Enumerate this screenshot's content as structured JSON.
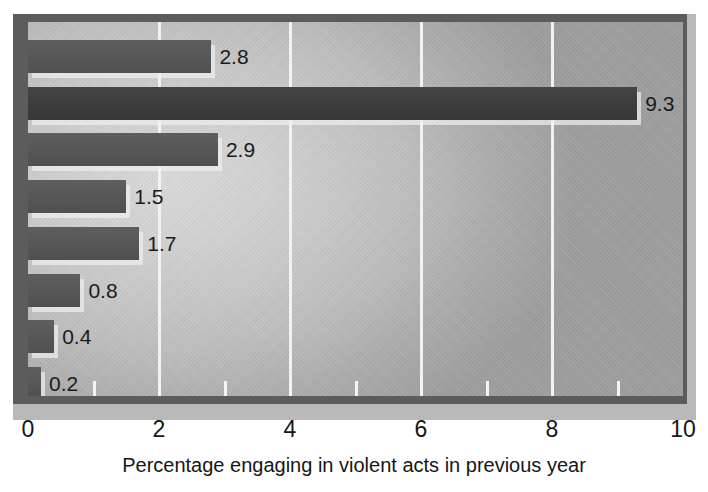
{
  "chart_data": {
    "type": "bar",
    "orientation": "horizontal",
    "title": "",
    "xlabel": "Percentage engaging in violent acts in previous year",
    "ylabel": "",
    "xlim": [
      0,
      10
    ],
    "xticks": [
      0,
      2,
      4,
      6,
      8,
      10
    ],
    "xtick_labels": [
      "0",
      "2",
      "4",
      "6",
      "8",
      "10"
    ],
    "minor_xticks": [
      1,
      2,
      3,
      4,
      5,
      6,
      7,
      8,
      9
    ],
    "gridlines": [
      2,
      4,
      6,
      8
    ],
    "grid": true,
    "legend": "none",
    "categories": [
      "",
      "",
      "",
      "",
      "",
      "",
      "",
      ""
    ],
    "values": [
      2.8,
      9.3,
      2.9,
      1.5,
      1.7,
      0.8,
      0.4,
      0.2
    ],
    "data_labels": [
      "2.8",
      "9.3",
      "2.9",
      "1.5",
      "1.7",
      "0.8",
      "0.4",
      "0.2"
    ],
    "bars": [
      {
        "value": 2.8,
        "label": "2.8",
        "highlight": false
      },
      {
        "value": 9.3,
        "label": "9.3",
        "highlight": true
      },
      {
        "value": 2.9,
        "label": "2.9",
        "highlight": false
      },
      {
        "value": 1.5,
        "label": "1.5",
        "highlight": false
      },
      {
        "value": 1.7,
        "label": "1.7",
        "highlight": false
      },
      {
        "value": 0.8,
        "label": "0.8",
        "highlight": false
      },
      {
        "value": 0.4,
        "label": "0.4",
        "highlight": false
      },
      {
        "value": 0.2,
        "label": "0.2",
        "highlight": false
      }
    ],
    "colors": {
      "bar": "#585858",
      "bar_highlight": "#3e3e3e",
      "gridline": "#f2f2f2",
      "plot_background_light": "#d8d8d8",
      "plot_background_dark": "#9d9d9d",
      "frame": "#5c5c5c",
      "frame_shadow": "#b9b9b9",
      "text": "#161616",
      "figure_background": "#ffffff"
    }
  }
}
